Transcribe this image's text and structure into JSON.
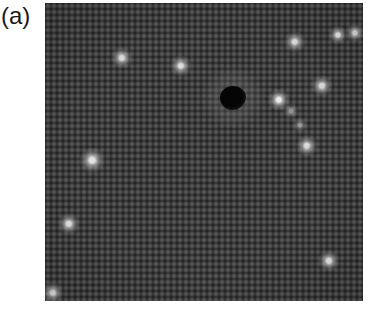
{
  "figure": {
    "panel_label": "(a)",
    "image": {
      "type": "STM topograph",
      "background_color": "#3b3b3b",
      "lattice_spacing_px": 6,
      "bright_spots": [
        {
          "x": 77,
          "y": 55,
          "r": 7,
          "intensity": 0.85
        },
        {
          "x": 136,
          "y": 63,
          "r": 7,
          "intensity": 0.85
        },
        {
          "x": 250,
          "y": 39,
          "r": 7,
          "intensity": 0.85
        },
        {
          "x": 293,
          "y": 32,
          "r": 6,
          "intensity": 0.9
        },
        {
          "x": 310,
          "y": 30,
          "r": 6,
          "intensity": 0.85
        },
        {
          "x": 277,
          "y": 83,
          "r": 7,
          "intensity": 0.85
        },
        {
          "x": 234,
          "y": 97,
          "r": 7,
          "intensity": 0.95
        },
        {
          "x": 246,
          "y": 108,
          "r": 5,
          "intensity": 0.5
        },
        {
          "x": 255,
          "y": 122,
          "r": 5,
          "intensity": 0.45
        },
        {
          "x": 262,
          "y": 143,
          "r": 7,
          "intensity": 0.85
        },
        {
          "x": 47,
          "y": 157,
          "r": 8,
          "intensity": 0.9
        },
        {
          "x": 24,
          "y": 221,
          "r": 7,
          "intensity": 0.9
        },
        {
          "x": 284,
          "y": 258,
          "r": 7,
          "intensity": 0.9
        },
        {
          "x": 8,
          "y": 290,
          "r": 7,
          "intensity": 0.85
        }
      ],
      "dark_defect": {
        "x": 188,
        "y": 95,
        "w": 26,
        "h": 24
      }
    }
  }
}
